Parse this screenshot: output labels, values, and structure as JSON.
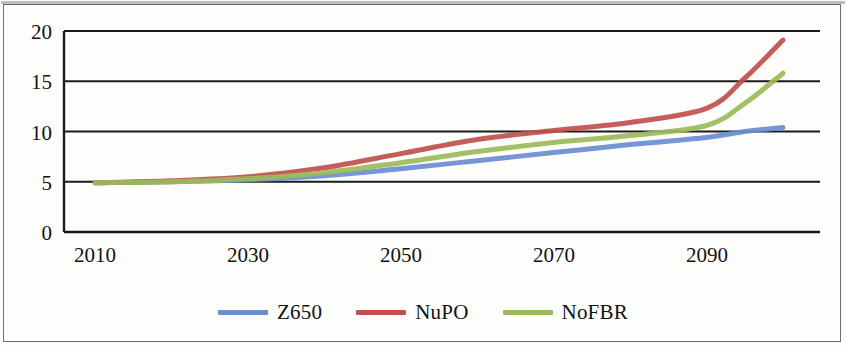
{
  "chart_data": {
    "type": "line",
    "title": "",
    "xlabel": "",
    "ylabel": "",
    "x": [
      2010,
      2020,
      2030,
      2040,
      2050,
      2060,
      2070,
      2080,
      2090,
      2095,
      2100
    ],
    "xlim": [
      2010,
      2100
    ],
    "ylim": [
      0,
      20
    ],
    "xticks": [
      2010,
      2030,
      2050,
      2070,
      2090
    ],
    "xticklabels": [
      "2010",
      "2030",
      "2050",
      "2070",
      "2090"
    ],
    "yticks": [
      0,
      5,
      10,
      15,
      20
    ],
    "yticklabels": [
      "0",
      "5",
      "10",
      "15",
      "20"
    ],
    "grid": "horizontal",
    "legend_position": "bottom",
    "series": [
      {
        "name": "Z650",
        "color": "#6b8dd1",
        "values": [
          4.9,
          5.0,
          5.2,
          5.6,
          6.3,
          7.1,
          7.9,
          8.7,
          9.4,
          10.0,
          10.4
        ]
      },
      {
        "name": "NuPO",
        "color": "#c0504d",
        "values": [
          4.9,
          5.1,
          5.5,
          6.4,
          7.8,
          9.2,
          10.1,
          10.9,
          12.3,
          15.3,
          19.1
        ]
      },
      {
        "name": "NoFBR",
        "color": "#9bbb59",
        "values": [
          4.9,
          5.0,
          5.3,
          5.9,
          6.9,
          8.0,
          8.9,
          9.6,
          10.6,
          12.8,
          15.8
        ]
      }
    ]
  },
  "axis": {
    "y_labels": [
      "20",
      "15",
      "10",
      "5",
      "0"
    ],
    "x_labels": [
      "2010",
      "2030",
      "2050",
      "2070",
      "2090"
    ]
  },
  "legend": {
    "items": [
      {
        "label": "Z650",
        "color": "#6b8dd1"
      },
      {
        "label": "NuPO",
        "color": "#c0504d"
      },
      {
        "label": "NoFBR",
        "color": "#9bbb59"
      }
    ]
  },
  "colors": {
    "axis": "#1a1a1a",
    "gridline": "#1a1a1a",
    "background": "#fdfdfc",
    "frame": "#6e6e6e"
  }
}
